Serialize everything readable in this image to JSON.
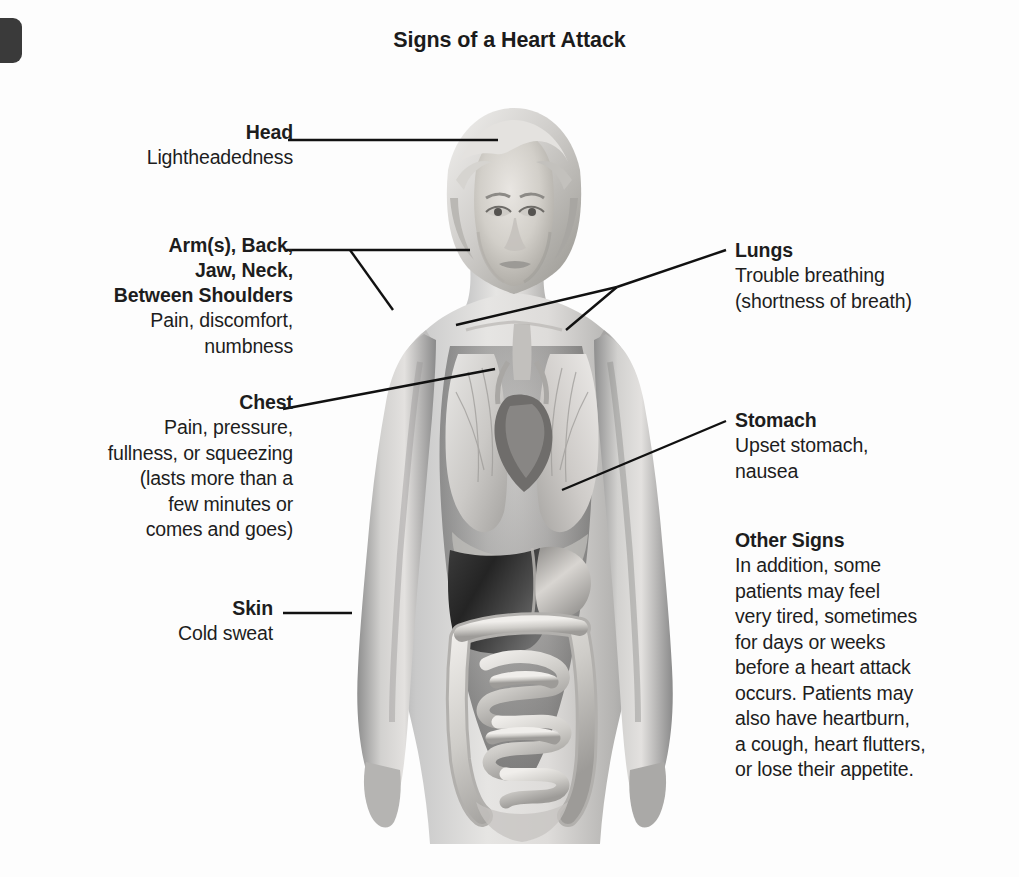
{
  "title": "Signs of a Heart Attack",
  "callouts": {
    "head": {
      "heading": "Head",
      "body": "Lightheadedness"
    },
    "arms": {
      "heading_line1": "Arm(s), Back,",
      "heading_line2": "Jaw, Neck,",
      "heading_line3": "Between Shoulders",
      "body_line1": "Pain, discomfort,",
      "body_line2": "numbness"
    },
    "chest": {
      "heading": "Chest",
      "body_line1": "Pain, pressure,",
      "body_line2": "fullness, or squeezing",
      "body_line3": "(lasts more than a",
      "body_line4": "few minutes or",
      "body_line5": "comes and goes)"
    },
    "skin": {
      "heading": "Skin",
      "body": "Cold sweat"
    },
    "lungs": {
      "heading": "Lungs",
      "body_line1": "Trouble breathing",
      "body_line2": "(shortness of breath)"
    },
    "stomach": {
      "heading": "Stomach",
      "body_line1": "Upset stomach,",
      "body_line2": "nausea"
    },
    "other": {
      "heading": "Other Signs",
      "body_line1": "In addition, some",
      "body_line2": "patients may feel",
      "body_line3": "very tired, sometimes",
      "body_line4": "for days or weeks",
      "body_line5": "before a heart attack",
      "body_line6": "occurs. Patients may",
      "body_line7": "also have heartburn,",
      "body_line8": "a cough, heart flutters,",
      "body_line9": "or lose their appetite."
    }
  },
  "colors": {
    "text": "#1d1d1d",
    "leader_line": "#111111",
    "background": "#ffffff",
    "artifact": "#3a3a3a"
  }
}
